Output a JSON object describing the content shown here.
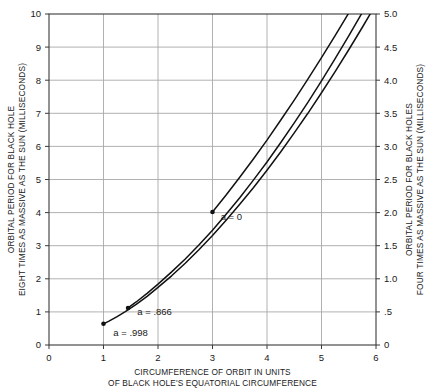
{
  "chart_data": {
    "type": "line",
    "title": "",
    "xlabel": "CIRCUMFERENCE OF ORBIT IN UNITS OF BLACK HOLE'S EQUATORIAL CIRCUMFERENCE",
    "xlabel_line1": "CIRCUMFERENCE OF ORBIT IN UNITS",
    "xlabel_line2": "OF BLACK HOLE'S EQUATORIAL CIRCUMFERENCE",
    "ylabel_left": "ORBITAL PERIOD FOR BLACK HOLE EIGHT TIMES AS MASSIVE AS THE SUN (MILLISECONDS)",
    "ylabel_left_line1": "ORBITAL PERIOD FOR BLACK HOLE",
    "ylabel_left_line2": "EIGHT TIMES AS MASSIVE AS THE SUN  (MILLISECONDS)",
    "ylabel_right": "ORBITAL PERIOD FOR BLACK HOLES FOUR TIMES AS MASSIVE AS THE SUN (MILLISECONDS)",
    "ylabel_right_line1": "ORBITAL PERIOD FOR BLACK HOLES",
    "ylabel_right_line2": "FOUR TIMES AS MASSIVE AS THE SUN  (MILLISECONDS)",
    "xlim": [
      0,
      6
    ],
    "ylim_left": [
      0,
      10
    ],
    "ylim_right": [
      0,
      5
    ],
    "xticks": [
      "0",
      "1",
      "2",
      "3",
      "4",
      "5",
      "6"
    ],
    "xtick_values": [
      0,
      1,
      2,
      3,
      4,
      5,
      6
    ],
    "yticks_left": [
      "0",
      "1",
      "2",
      "3",
      "4",
      "5",
      "6",
      "7",
      "8",
      "9",
      "10"
    ],
    "ytick_values_left": [
      0,
      1,
      2,
      3,
      4,
      5,
      6,
      7,
      8,
      9,
      10
    ],
    "yticks_right": [
      "0",
      ".5",
      "1.0",
      "1.5",
      "2.0",
      "2.5",
      "3.0",
      "3.5",
      "4.0",
      "4.5",
      "5.0"
    ],
    "ytick_values_right": [
      0,
      0.5,
      1.0,
      1.5,
      2.0,
      2.5,
      3.0,
      3.5,
      4.0,
      4.5,
      5.0
    ],
    "grid": true,
    "grid_color": "#a8a8a8",
    "curve_color": "#111111",
    "legend_position": "inline-annotations",
    "series": [
      {
        "name": "a = 0",
        "label": "a = 0",
        "spin": 0,
        "marker_point": {
          "x": 3.0,
          "y": 4.02
        },
        "x": [
          3.0,
          3.25,
          3.5,
          3.75,
          4.0,
          4.25,
          4.5,
          4.75,
          5.0,
          5.25,
          5.5,
          5.75,
          6.0
        ],
        "y": [
          4.02,
          4.53,
          5.07,
          5.62,
          6.19,
          6.79,
          7.4,
          8.03,
          8.68,
          9.35,
          10.03,
          10.74,
          11.46
        ]
      },
      {
        "name": "a = .866",
        "label": "a = .866",
        "spin": 0.866,
        "marker_point": {
          "x": 1.45,
          "y": 1.12
        },
        "x": [
          1.45,
          1.6,
          1.8,
          2.0,
          2.25,
          2.5,
          2.75,
          3.0,
          3.25,
          3.5,
          3.75,
          4.0,
          4.25,
          4.5,
          4.75,
          5.0,
          5.25,
          5.5,
          5.75,
          6.0
        ],
        "y": [
          1.12,
          1.3,
          1.56,
          1.84,
          2.21,
          2.6,
          3.02,
          3.47,
          3.95,
          4.45,
          4.98,
          5.53,
          6.11,
          6.71,
          7.33,
          7.98,
          8.65,
          9.34,
          10.05,
          10.78
        ]
      },
      {
        "name": "a = .998",
        "label": "a = .998",
        "spin": 0.998,
        "marker_point": {
          "x": 1.0,
          "y": 0.64
        },
        "x": [
          1.0,
          1.1,
          1.25,
          1.4,
          1.6,
          1.8,
          2.0,
          2.25,
          2.5,
          2.75,
          3.0,
          3.25,
          3.5,
          3.75,
          4.0,
          4.25,
          4.5,
          4.75,
          5.0,
          5.25,
          5.5,
          5.75,
          6.0
        ],
        "y": [
          0.64,
          0.72,
          0.86,
          1.01,
          1.23,
          1.47,
          1.74,
          2.09,
          2.47,
          2.88,
          3.31,
          3.77,
          4.25,
          4.75,
          5.28,
          5.83,
          6.41,
          7.0,
          7.62,
          8.26,
          8.92,
          9.6,
          10.3
        ]
      }
    ],
    "annotations": [
      {
        "text": "a = 0",
        "x": 3.15,
        "y": 3.78
      },
      {
        "text": "a = .866",
        "x": 1.62,
        "y": 0.92
      },
      {
        "text": "a = .998",
        "x": 1.18,
        "y": 0.28
      }
    ]
  }
}
